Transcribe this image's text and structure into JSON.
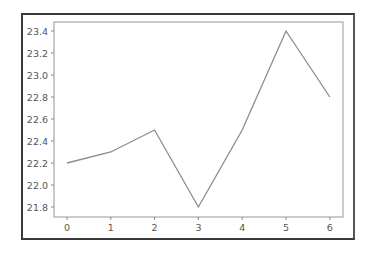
{
  "chart_data": {
    "type": "line",
    "title": "",
    "xlabel": "",
    "ylabel": "",
    "x": [
      0,
      1,
      2,
      3,
      4,
      5,
      6
    ],
    "series": [
      {
        "name": "series-0",
        "values": [
          22.2,
          22.3,
          22.5,
          21.8,
          22.5,
          23.4,
          22.8
        ],
        "color": "#8c8c8c"
      }
    ],
    "xticks": [
      "0",
      "1",
      "2",
      "3",
      "4",
      "5",
      "6"
    ],
    "yticks": [
      "21.8",
      "22.0",
      "22.2",
      "22.4",
      "22.6",
      "22.8",
      "23.0",
      "23.2",
      "23.4"
    ],
    "xlim": [
      -0.3,
      6.3
    ],
    "ylim": [
      21.71,
      23.49
    ],
    "grid": false,
    "legend": null
  },
  "labels": {
    "x0": "0",
    "x1": "1",
    "x2": "2",
    "x3": "3",
    "x4": "4",
    "x5": "5",
    "x6": "6",
    "y0": "21.8",
    "y1": "22.0",
    "y2": "22.2",
    "y3": "22.4",
    "y4": "22.6",
    "y5": "22.8",
    "y6": "23.0",
    "y7": "23.2",
    "y8": "23.4"
  }
}
